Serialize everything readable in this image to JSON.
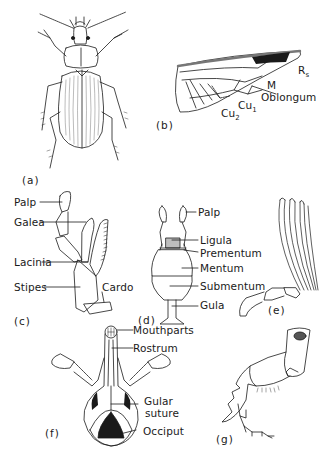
{
  "figure": {
    "panels": [
      {
        "id": "a",
        "tag": "(a)",
        "subject": "beetle-dorsal-view",
        "labels": []
      },
      {
        "id": "b",
        "tag": "(b)",
        "subject": "hind-wing",
        "labels": [
          {
            "text": "R",
            "sub": "s"
          },
          {
            "text": "M"
          },
          {
            "text": "Oblongum"
          },
          {
            "text": "Cu",
            "sub": "1"
          },
          {
            "text": "Cu",
            "sub": "2"
          }
        ]
      },
      {
        "id": "c",
        "tag": "(c)",
        "subject": "maxilla",
        "labels": [
          {
            "text": "Palp"
          },
          {
            "text": "Galea"
          },
          {
            "text": "Lacinia"
          },
          {
            "text": "Stipes"
          },
          {
            "text": "Cardo"
          }
        ]
      },
      {
        "id": "d",
        "tag": "(d)",
        "subject": "labium",
        "labels": [
          {
            "text": "Palp"
          },
          {
            "text": "Ligula"
          },
          {
            "text": "Prementum"
          },
          {
            "text": "Mentum"
          },
          {
            "text": "Submentum"
          },
          {
            "text": "Gula"
          }
        ]
      },
      {
        "id": "e",
        "tag": "(e)",
        "subject": "lamellate-antenna",
        "labels": []
      },
      {
        "id": "f",
        "tag": "(f)",
        "subject": "weevil-head-ventral",
        "labels": [
          {
            "text": "Mouthparts"
          },
          {
            "text": "Rostrum"
          },
          {
            "text": "Gular suture"
          },
          {
            "text": "Occiput"
          }
        ]
      },
      {
        "id": "g",
        "tag": "(g)",
        "subject": "fossorial-foreleg",
        "labels": []
      }
    ]
  },
  "labels": {
    "a_tag": "(a)",
    "b_tag": "(b)",
    "b_rs": "R",
    "b_rs_sub": "s",
    "b_m": "M",
    "b_oblongum": "Oblongum",
    "b_cu1": "Cu",
    "b_cu1_sub": "1",
    "b_cu2": "Cu",
    "b_cu2_sub": "2",
    "c_tag": "(c)",
    "c_palp": "Palp",
    "c_galea": "Galea",
    "c_lacinia": "Lacinia",
    "c_stipes": "Stipes",
    "c_cardo": "Cardo",
    "d_tag": "(d)",
    "d_palp": "Palp",
    "d_ligula": "Ligula",
    "d_prementum": "Prementum",
    "d_mentum": "Mentum",
    "d_submentum": "Submentum",
    "d_gula": "Gula",
    "e_tag": "(e)",
    "f_tag": "(f)",
    "f_mouthparts": "Mouthparts",
    "f_rostrum": "Rostrum",
    "f_gular1": "Gular",
    "f_gular2": "suture",
    "f_occiput": "Occiput",
    "g_tag": "(g)"
  },
  "colors": {
    "ink": "#1a1a1a",
    "paper": "#ffffff",
    "shade": "#bdbdbd"
  }
}
